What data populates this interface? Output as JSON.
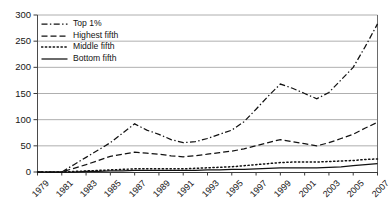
{
  "chart_data": {
    "type": "line",
    "title": "",
    "xlabel": "",
    "ylabel": "",
    "x": [
      1979,
      1980,
      1981,
      1982,
      1983,
      1984,
      1985,
      1986,
      1987,
      1988,
      1989,
      1990,
      1991,
      1992,
      1993,
      1994,
      1995,
      1996,
      1997,
      1998,
      1999,
      2000,
      2001,
      2002,
      2003,
      2004,
      2005,
      2006,
      2007
    ],
    "xticks": [
      "1979",
      "1981",
      "1983",
      "1985",
      "1987",
      "1989",
      "1991",
      "1993",
      "1995",
      "1997",
      "1999",
      "2001",
      "2003",
      "2005",
      "2007"
    ],
    "yticks": [
      "0",
      "50",
      "100",
      "150",
      "200",
      "250",
      "300"
    ],
    "ylim": [
      0,
      300
    ],
    "xlim": [
      1979,
      2007
    ],
    "grid": "horizontal",
    "legend_position": "top-left",
    "series": [
      {
        "name": "Top 1%",
        "style": "dash-dot",
        "color": "#111111",
        "values": [
          0,
          0,
          0,
          14,
          28,
          42,
          56,
          74,
          92,
          80,
          72,
          62,
          56,
          58,
          64,
          72,
          80,
          96,
          120,
          145,
          168,
          160,
          150,
          140,
          152,
          176,
          200,
          240,
          283
        ]
      },
      {
        "name": "Highest fifth",
        "style": "dashed",
        "color": "#111111",
        "values": [
          0,
          0,
          0,
          7,
          14,
          22,
          30,
          34,
          38,
          36,
          34,
          31,
          29,
          31,
          34,
          37,
          40,
          44,
          50,
          56,
          62,
          58,
          54,
          50,
          56,
          64,
          72,
          84,
          95
        ]
      },
      {
        "name": "Middle fifth",
        "style": "dotted",
        "color": "#111111",
        "values": [
          0,
          0,
          0,
          1,
          2,
          3,
          4,
          5,
          6,
          6,
          6,
          6,
          6,
          7,
          8,
          9,
          10,
          12,
          14,
          16,
          18,
          19,
          19,
          19,
          20,
          21,
          22,
          24,
          25
        ]
      },
      {
        "name": "Bottom fifth",
        "style": "solid",
        "color": "#111111",
        "values": [
          0,
          0,
          0,
          0,
          1,
          1,
          2,
          2,
          3,
          3,
          3,
          3,
          3,
          3,
          4,
          4,
          5,
          5,
          6,
          7,
          8,
          8,
          8,
          8,
          9,
          10,
          12,
          14,
          16
        ]
      }
    ]
  },
  "legend": {
    "items": [
      {
        "label": "Top 1%",
        "style": "dash-dot"
      },
      {
        "label": "Highest fifth",
        "style": "dashed"
      },
      {
        "label": "Middle fifth",
        "style": "dotted"
      },
      {
        "label": "Bottom fifth",
        "style": "solid"
      }
    ]
  }
}
